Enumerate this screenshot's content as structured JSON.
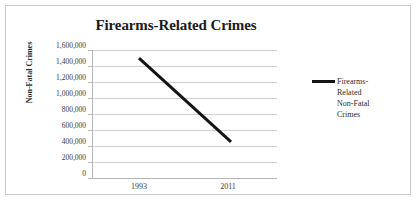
{
  "chart_data": {
    "type": "line",
    "title": "Firearms-Related Crimes",
    "xlabel": "",
    "ylabel": "Non-Fatal Crimes",
    "categories": [
      "1993",
      "2011"
    ],
    "series": [
      {
        "name": "Firearms-Related Non-Fatal Crimes",
        "values": [
          1500000,
          460000
        ],
        "color": "#141414"
      }
    ],
    "ylim": [
      0,
      1600000
    ],
    "ytick_step": 200000,
    "ytick_labels": [
      "1,600,000",
      "1,400,000",
      "1,200,000",
      "1,000,000",
      "800,000",
      "600,000",
      "400,000",
      "200,000",
      "0"
    ],
    "ytick_values": [
      1600000,
      1400000,
      1200000,
      1000000,
      800000,
      600000,
      400000,
      200000,
      0
    ],
    "grid": true,
    "legend_position": "right",
    "legend_entries": [
      "Firearms-Related Non-Fatal Crimes"
    ],
    "legend_lines": [
      "Firearms-",
      "Related",
      "Non-Fatal",
      "Crimes"
    ]
  },
  "frame": {
    "border_color": "#c9c9c9",
    "background": "#ffffff"
  },
  "colors": {
    "series_line": "#141414",
    "gridline": "#d2d2d2",
    "axis_line": "#b5b5b5",
    "text": "#2b2b2b"
  }
}
